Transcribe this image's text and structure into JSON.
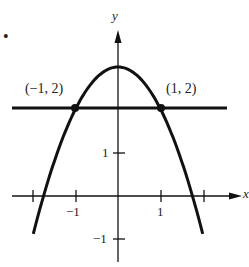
{
  "chart_data": {
    "type": "line",
    "title": "",
    "xlabel": "x",
    "ylabel": "y",
    "xlim": [
      -2.2,
      2.8
    ],
    "ylim": [
      -1.6,
      3.6
    ],
    "x_ticks": [
      -2,
      -1,
      1,
      2
    ],
    "x_tick_labels": [
      "",
      "-1",
      "1",
      ""
    ],
    "y_ticks": [
      1,
      -1
    ],
    "y_tick_labels": [
      "1",
      "-1"
    ],
    "grid": false,
    "series": [
      {
        "name": "y = 3 - x^2",
        "type": "curve",
        "x": [
          -2.0,
          -1.732,
          -1,
          0,
          1,
          1.732,
          2.0
        ],
        "y": [
          -1,
          0,
          2,
          3,
          2,
          0,
          -1
        ]
      },
      {
        "name": "y = 2",
        "type": "line",
        "x": [
          -2.0,
          2.8
        ],
        "y": [
          2,
          2
        ]
      }
    ],
    "points": [
      {
        "x": -1,
        "y": 2,
        "label": "(−1, 2)"
      },
      {
        "x": 1,
        "y": 2,
        "label": "(1, 2)"
      }
    ]
  },
  "labels": {
    "bullet": "•",
    "y_axis": "y",
    "x_axis": "x",
    "point_left": "(−1, 2)",
    "point_right": "(1, 2)",
    "tick_x_neg1": "−1",
    "tick_x_1": "1",
    "tick_y_1": "1",
    "tick_y_neg1": "−1"
  }
}
